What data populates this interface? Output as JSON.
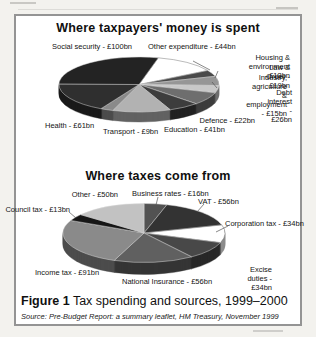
{
  "colors": {
    "outer_background": "#f3f2ee",
    "panel_background": "#ffffff",
    "panel_border": "#949494",
    "text": "#101010",
    "leader_line": "#555555"
  },
  "figure": {
    "caption_prefix": "Figure 1",
    "caption_text": "Tax spending and sources, 1999–2000",
    "source_prefix": "Source:",
    "source_italic": "Pre-Budget Report: a summary leaflet",
    "source_rest": ", HM Treasury, November 1999"
  },
  "chart_data": [
    {
      "type": "pie",
      "style": "3d-pie",
      "title": "Where taxpayers' money is spent",
      "unit": "£bn",
      "total": 350,
      "legend_position": "around",
      "layout": {
        "cx": 139,
        "cy": 84.5,
        "rx": 80,
        "ry": 27.5,
        "depth": 10,
        "start_angle_deg": 14,
        "clockwise": true
      },
      "slices": [
        {
          "name": "Other expenditure",
          "value": 44,
          "color": "#ffffff",
          "label": "Other expenditure - £44bn",
          "label_pos": {
            "x": 148,
            "y": 42,
            "align": "left"
          }
        },
        {
          "name": "Housing & environment",
          "value": 13,
          "color": "#4a4a4a",
          "label": "Housing & environment - £13bn",
          "label_pos": {
            "x": 290,
            "y": 53,
            "align": "right"
          },
          "line": [
            193,
            61,
            210,
            70
          ]
        },
        {
          "name": "Law & Order",
          "value": 19,
          "color": "#969696",
          "label": "Law & Order - £19bn",
          "label_pos": {
            "x": 290,
            "y": 63,
            "align": "right"
          },
          "line": [
            218,
            71,
            215,
            78
          ]
        },
        {
          "name": "Industry, agriculture & employment",
          "value": 15,
          "color": "#c8c8c8",
          "label": "Industry, agriculture &\nemployment - £15bn",
          "label_pos": {
            "x": 287,
            "y": 73,
            "align": "right"
          },
          "line": [
            212,
            82,
            217,
            88
          ]
        },
        {
          "name": "Debt interest",
          "value": 26,
          "color": "#6e6e6e",
          "label": "Debt interest - £26bn",
          "label_pos": {
            "x": 292,
            "y": 88,
            "align": "right"
          }
        },
        {
          "name": "Defence",
          "value": 22,
          "color": "#3d3d3d",
          "label": "Defence - £22bn",
          "label_pos": {
            "x": 255,
            "y": 116,
            "align": "right"
          }
        },
        {
          "name": "Education",
          "value": 41,
          "color": "#b2b2b2",
          "label": "Education - £41bn",
          "label_pos": {
            "x": 164,
            "y": 125,
            "align": "left"
          }
        },
        {
          "name": "Transport",
          "value": 9,
          "color": "#8a8a8a",
          "label": "Transport - £9bn",
          "label_pos": {
            "x": 103,
            "y": 127,
            "align": "left"
          }
        },
        {
          "name": "Health",
          "value": 61,
          "color": "#2f2f2f",
          "label": "Health - £61bn",
          "label_pos": {
            "x": 45,
            "y": 121,
            "align": "left"
          }
        },
        {
          "name": "Social security",
          "value": 100,
          "color": "#232323",
          "label": "Social security - £100bn",
          "label_pos": {
            "x": 52,
            "y": 42,
            "align": "left"
          }
        }
      ]
    },
    {
      "type": "pie",
      "style": "3d-pie",
      "title": "Where taxes come from",
      "unit": "£bn",
      "total": 350,
      "legend_position": "around",
      "layout": {
        "cx": 144,
        "cy": 233,
        "rx": 81,
        "ry": 29.5,
        "depth": 12,
        "start_angle_deg": 0,
        "clockwise": true
      },
      "slices": [
        {
          "name": "Business rates",
          "value": 16,
          "color": "#525252",
          "label": "Business rates - £16bn",
          "label_pos": {
            "x": 132,
            "y": 189,
            "align": "left"
          },
          "line": [
            158,
            197,
            156,
            205
          ]
        },
        {
          "name": "VAT",
          "value": 56,
          "color": "#333333",
          "label": "VAT - £56bn",
          "label_pos": {
            "x": 198,
            "y": 197,
            "align": "left"
          },
          "line": [
            204,
            204,
            197,
            212
          ]
        },
        {
          "name": "Corporation tax",
          "value": 34,
          "color": "#ffffff",
          "label": "Corporation tax - £34bn",
          "label_pos": {
            "x": 225,
            "y": 219,
            "align": "left"
          },
          "line": [
            228,
            226,
            216,
            232
          ]
        },
        {
          "name": "Excise duties",
          "value": 34,
          "color": "#484848",
          "label": "Excise duties - £34bn",
          "label_pos": {
            "x": 272,
            "y": 265,
            "align": "right"
          }
        },
        {
          "name": "National Insurance",
          "value": 56,
          "color": "#606060",
          "label": "National Insurance - £56bn",
          "label_pos": {
            "x": 122,
            "y": 277,
            "align": "left"
          }
        },
        {
          "name": "Income tax",
          "value": 91,
          "color": "#8a8a8a",
          "label": "Income tax - £91bn",
          "label_pos": {
            "x": 35,
            "y": 268,
            "align": "left"
          }
        },
        {
          "name": "Council tax",
          "value": 13,
          "color": "#161616",
          "label": "Council tax - £13bn",
          "label_pos": {
            "x": 70,
            "y": 205,
            "align": "right"
          },
          "line": [
            69,
            212,
            76,
            218
          ]
        },
        {
          "name": "Other",
          "value": 50,
          "color": "#c2c2c2",
          "label": "Other - £50bn",
          "label_pos": {
            "x": 118,
            "y": 190,
            "align": "right"
          }
        }
      ]
    }
  ]
}
